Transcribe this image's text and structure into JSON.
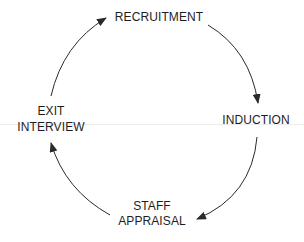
{
  "diagram": {
    "type": "cycle",
    "nodes": [
      {
        "id": "recruitment",
        "lines": [
          "RECRUITMENT"
        ]
      },
      {
        "id": "induction",
        "lines": [
          "INDUCTION"
        ]
      },
      {
        "id": "staff-appraisal",
        "lines": [
          "STAFF",
          "APPRAISAL"
        ]
      },
      {
        "id": "exit-interview",
        "lines": [
          "EXIT",
          "INTERVIEW"
        ]
      }
    ],
    "edges": [
      {
        "from": "recruitment",
        "to": "induction"
      },
      {
        "from": "induction",
        "to": "staff-appraisal"
      },
      {
        "from": "staff-appraisal",
        "to": "exit-interview"
      },
      {
        "from": "exit-interview",
        "to": "recruitment"
      }
    ],
    "direction": "clockwise",
    "colors": {
      "text": "#1e1e1e",
      "arrow": "#2a2a2a",
      "background": "#ffffff"
    }
  }
}
